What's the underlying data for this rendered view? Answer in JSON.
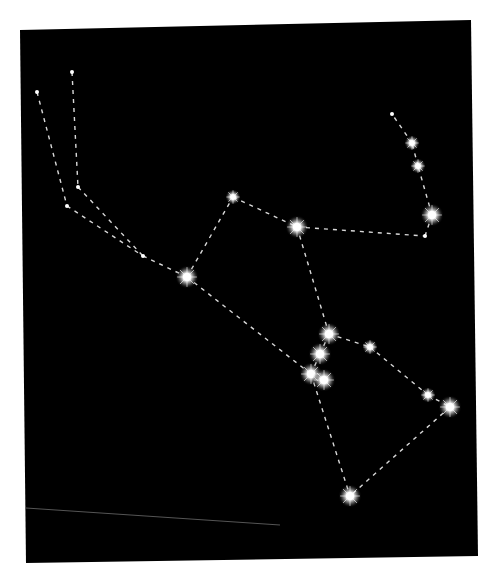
{
  "diagram": {
    "background_color": "#000000",
    "page_color": "#ffffff",
    "line_color": "#d8d8d8",
    "star_color": "#ffffff",
    "frame": {
      "corners": [
        [
          20,
          30
        ],
        [
          471,
          20
        ],
        [
          478,
          556
        ],
        [
          26,
          563
        ]
      ]
    },
    "stars": [
      {
        "id": "s1",
        "x": 37,
        "y": 92,
        "size": "tiny"
      },
      {
        "id": "s2",
        "x": 72,
        "y": 72,
        "size": "tiny"
      },
      {
        "id": "s3",
        "x": 78,
        "y": 187,
        "size": "tiny"
      },
      {
        "id": "s4",
        "x": 67,
        "y": 206,
        "size": "tiny"
      },
      {
        "id": "s5",
        "x": 143,
        "y": 256,
        "size": "tiny"
      },
      {
        "id": "s6",
        "x": 233,
        "y": 197,
        "size": "medium"
      },
      {
        "id": "s7",
        "x": 187,
        "y": 277,
        "size": "large"
      },
      {
        "id": "s8",
        "x": 297,
        "y": 227,
        "size": "large"
      },
      {
        "id": "s9",
        "x": 392,
        "y": 114,
        "size": "tiny"
      },
      {
        "id": "s10",
        "x": 412,
        "y": 143,
        "size": "medium"
      },
      {
        "id": "s11",
        "x": 418,
        "y": 166,
        "size": "medium"
      },
      {
        "id": "s12",
        "x": 432,
        "y": 215,
        "size": "large"
      },
      {
        "id": "s13",
        "x": 425,
        "y": 236,
        "size": "tiny"
      },
      {
        "id": "s14",
        "x": 329,
        "y": 334,
        "size": "large"
      },
      {
        "id": "s15",
        "x": 320,
        "y": 354,
        "size": "large"
      },
      {
        "id": "s16",
        "x": 311,
        "y": 374,
        "size": "large"
      },
      {
        "id": "s17",
        "x": 324,
        "y": 380,
        "size": "large"
      },
      {
        "id": "s18",
        "x": 370,
        "y": 347,
        "size": "medium"
      },
      {
        "id": "s19",
        "x": 428,
        "y": 395,
        "size": "medium"
      },
      {
        "id": "s20",
        "x": 450,
        "y": 407,
        "size": "large"
      },
      {
        "id": "s21",
        "x": 350,
        "y": 496,
        "size": "large"
      }
    ],
    "lines": [
      [
        "s1",
        "s4"
      ],
      [
        "s2",
        "s3"
      ],
      [
        "s4",
        "s5"
      ],
      [
        "s3",
        "s5"
      ],
      [
        "s5",
        "s7"
      ],
      [
        "s7",
        "s6"
      ],
      [
        "s6",
        "s8"
      ],
      [
        "s8",
        "s13"
      ],
      [
        "s13",
        "s12"
      ],
      [
        "s12",
        "s11"
      ],
      [
        "s11",
        "s10"
      ],
      [
        "s10",
        "s9"
      ],
      [
        "s8",
        "s14"
      ],
      [
        "s7",
        "s16"
      ],
      [
        "s14",
        "s15"
      ],
      [
        "s15",
        "s16"
      ],
      [
        "s16",
        "s17"
      ],
      [
        "s14",
        "s18"
      ],
      [
        "s18",
        "s19"
      ],
      [
        "s19",
        "s20"
      ],
      [
        "s20",
        "s21"
      ],
      [
        "s16",
        "s21"
      ]
    ],
    "stray_line": {
      "x1": 26,
      "y1": 508,
      "x2": 280,
      "y2": 525,
      "color": "#555555"
    }
  }
}
